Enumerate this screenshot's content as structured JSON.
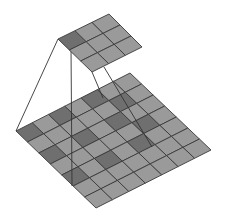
{
  "diagram": {
    "kind": "dilated-convolution-illustration",
    "colors": {
      "background": "#ffffff",
      "cell_light": "#9a9a9a",
      "cell_dark": "#6f6f6f",
      "grid_line": "#3a3a3a",
      "projection_line": "#333333"
    },
    "kernel_grid": {
      "rows": 3,
      "cols": 3,
      "corners": {
        "left": [
          58,
          39
        ],
        "top": [
          109,
          14
        ],
        "right": [
          142,
          47
        ],
        "bottom": [
          92,
          72
        ]
      },
      "dark_cells": [
        [
          0,
          0
        ]
      ]
    },
    "input_grid": {
      "rows": 7,
      "cols": 7,
      "corners": {
        "left": [
          16,
          131
        ],
        "top": [
          130,
          73
        ],
        "right": [
          211,
          150
        ],
        "bottom": [
          96,
          208
        ]
      },
      "dark_cells": [
        [
          0,
          0
        ],
        [
          0,
          2
        ],
        [
          0,
          4
        ],
        [
          2,
          0
        ],
        [
          2,
          2
        ],
        [
          2,
          4
        ],
        [
          4,
          0
        ],
        [
          4,
          2
        ],
        [
          4,
          4
        ],
        [
          1,
          5
        ],
        [
          3,
          5
        ]
      ]
    },
    "projection_lines": [
      {
        "from": [
          58,
          39
        ],
        "to": [
          16,
          131
        ]
      },
      {
        "from": [
          71,
          46
        ],
        "to": [
          72,
          186
        ]
      },
      {
        "from": [
          92,
          72
        ],
        "to": [
          103,
          98
        ]
      },
      {
        "from": [
          104,
          67
        ],
        "to": [
          152,
          147
        ]
      }
    ]
  }
}
